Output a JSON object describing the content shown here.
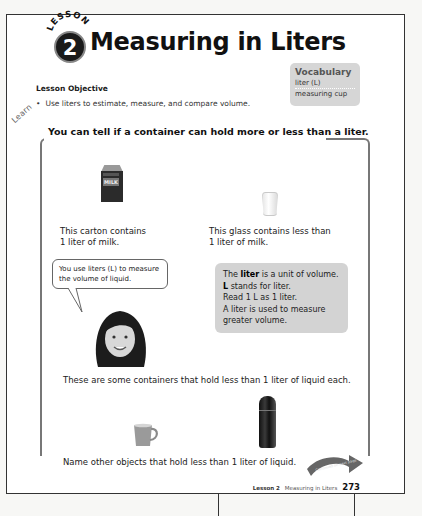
{
  "header": {
    "lesson_word": "LESSON",
    "lesson_number": "2",
    "title": "Measuring in Liters"
  },
  "vocabulary": {
    "heading": "Vocabulary",
    "items": [
      "liter (L)",
      "measuring cup"
    ]
  },
  "objective": {
    "heading": "Lesson Objective",
    "bullet": "Use liters to estimate, measure, and compare volume."
  },
  "learn": {
    "label": "Learn",
    "heading": "You can tell if a container can hold more or less than a liter.",
    "carton_label": "MILK",
    "carton_caption_1": "This carton contains",
    "carton_caption_2": "1 liter of milk.",
    "glass_caption_1": "This glass contains less than",
    "glass_caption_2": "1 liter of milk.",
    "speech_bubble": "You use liters (L) to measure the volume of liquid.",
    "info_box": {
      "line1_pre": "The ",
      "line1_bold": "liter",
      "line1_post": " is a unit of volume.",
      "line2_bold": "L",
      "line2_post": " stands for liter.",
      "line3": "Read 1 L as 1 liter.",
      "line4": "A liter is used to measure",
      "line5": "greater volume."
    },
    "containers_caption": "These are some containers that hold less than 1 liter of liquid each.",
    "name_prompt": "Name other objects that hold less than 1 liter of liquid.",
    "continue_label": "Continued on next page"
  },
  "footer": {
    "lesson": "Lesson 2",
    "title": "Measuring in Liters",
    "page_number": "273"
  },
  "colors": {
    "page_bg": "#ffffff",
    "panel_gray": "#d3d3d3",
    "frame_gray": "#777777",
    "text": "#1a1a1a"
  }
}
